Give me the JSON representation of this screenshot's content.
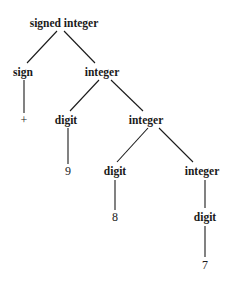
{
  "nodes": {
    "root": {
      "label": "signed integer",
      "x": 64,
      "y": 27
    },
    "sign": {
      "label": "sign",
      "x": 23,
      "y": 76
    },
    "int1": {
      "label": "integer",
      "x": 102,
      "y": 76
    },
    "plus": {
      "label": "+",
      "x": 24,
      "y": 124
    },
    "digit1": {
      "label": "digit",
      "x": 66,
      "y": 124
    },
    "int2": {
      "label": "integer",
      "x": 146,
      "y": 124
    },
    "nine": {
      "label": "9",
      "x": 68,
      "y": 175
    },
    "digit2": {
      "label": "digit",
      "x": 115,
      "y": 175
    },
    "int3": {
      "label": "integer",
      "x": 202,
      "y": 175
    },
    "eight": {
      "label": "8",
      "x": 115,
      "y": 221
    },
    "digit3": {
      "label": "digit",
      "x": 205,
      "y": 221
    },
    "seven": {
      "label": "7",
      "x": 205,
      "y": 269
    }
  },
  "edges": [
    [
      "root",
      "sign"
    ],
    [
      "root",
      "int1"
    ],
    [
      "sign",
      "plus"
    ],
    [
      "int1",
      "digit1"
    ],
    [
      "int1",
      "int2"
    ],
    [
      "digit1",
      "nine"
    ],
    [
      "int2",
      "digit2"
    ],
    [
      "int2",
      "int3"
    ],
    [
      "digit2",
      "eight"
    ],
    [
      "int3",
      "digit3"
    ],
    [
      "digit3",
      "seven"
    ]
  ]
}
